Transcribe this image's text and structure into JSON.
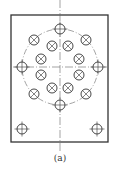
{
  "figure": {
    "caption": "(a)",
    "plate": {
      "x": 11,
      "y": 15,
      "width": 97,
      "height": 127
    },
    "center": {
      "x": 60,
      "y": 67
    },
    "centerlines": {
      "vertical": {
        "x": 60,
        "y1": 0,
        "y2": 152
      },
      "horizontal": {
        "y": 67,
        "x1": 13,
        "x2": 107
      }
    },
    "pitch_circle": {
      "radius": 38
    },
    "outer_holes": [
      {
        "x": 60,
        "y": 29,
        "type": "plus"
      },
      {
        "x": 34,
        "y": 40,
        "type": "cross"
      },
      {
        "x": 86,
        "y": 40,
        "type": "cross"
      },
      {
        "x": 22,
        "y": 67,
        "type": "plus"
      },
      {
        "x": 98,
        "y": 67,
        "type": "plus"
      },
      {
        "x": 34,
        "y": 94,
        "type": "cross"
      },
      {
        "x": 86,
        "y": 94,
        "type": "cross"
      },
      {
        "x": 60,
        "y": 105,
        "type": "plus"
      }
    ],
    "inner_holes": [
      {
        "x": 52,
        "y": 46,
        "type": "cross"
      },
      {
        "x": 68,
        "y": 46,
        "type": "cross"
      },
      {
        "x": 41,
        "y": 59,
        "type": "cross"
      },
      {
        "x": 79,
        "y": 59,
        "type": "cross"
      },
      {
        "x": 41,
        "y": 75,
        "type": "cross"
      },
      {
        "x": 79,
        "y": 75,
        "type": "cross"
      },
      {
        "x": 52,
        "y": 88,
        "type": "cross"
      },
      {
        "x": 68,
        "y": 88,
        "type": "cross"
      }
    ],
    "corner_holes": [
      {
        "x": 22,
        "y": 129,
        "type": "plus"
      },
      {
        "x": 97,
        "y": 129,
        "type": "plus"
      }
    ],
    "hole_radius": 5,
    "line_color": "#333333",
    "centerline_color": "#666666"
  }
}
